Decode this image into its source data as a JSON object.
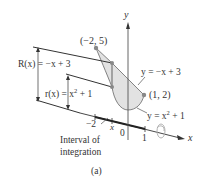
{
  "figure": {
    "caption": "(a)",
    "axes": {
      "x_label": "x",
      "y_label": "y",
      "ticks": {
        "neg2": "−2",
        "zero": "0",
        "one": "1",
        "x_mark": "x"
      }
    },
    "points": [
      {
        "label": "(−2, 5)",
        "x": -2,
        "y": 5
      },
      {
        "label": "(1, 2)",
        "x": 1,
        "y": 2
      }
    ],
    "curves": {
      "line_label": "y = −x + 3",
      "parabola_label_prefix": "y = x",
      "parabola_label_exp": "2",
      "parabola_label_suffix": " + 1"
    },
    "radii": {
      "outer_prefix": "R(x) = −x + 3",
      "inner_prefix": "r(x) = x",
      "inner_exp": "2",
      "inner_suffix": " + 1"
    },
    "interval_label_line1": "Interval of",
    "interval_label_line2": "integration",
    "colors": {
      "region_fill": "#e2e2e2",
      "line": "#333333",
      "point": "#888888",
      "rotation_icon": "#aaaaaa"
    }
  }
}
